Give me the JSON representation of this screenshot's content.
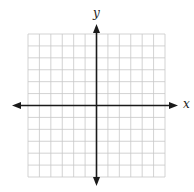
{
  "diagram": {
    "type": "coordinate-plane",
    "x_axis_label": "x",
    "y_axis_label": "y",
    "grid": {
      "columns": 12,
      "rows": 12,
      "left": 28,
      "top": 34,
      "right": 165,
      "bottom": 177,
      "line_color": "#c8c8c8"
    },
    "axes": {
      "origin_x": 96,
      "origin_y": 106,
      "color": "#1a1a1a",
      "x_start": 12,
      "x_end": 178,
      "y_start": 24,
      "y_end": 186
    },
    "colors": {
      "background": "#ffffff",
      "grid": "#c8c8c8",
      "axis": "#1a1a1a"
    }
  }
}
